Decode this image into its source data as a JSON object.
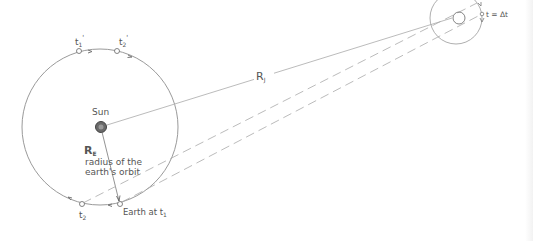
{
  "diagram": {
    "type": "orbital-geometry",
    "colors": {
      "line": "#9a9a9a",
      "text": "#555555",
      "sun": "#666666"
    },
    "sun": {
      "label": "Sun"
    },
    "earth_orbit": {
      "radius_label": "R",
      "radius_subscript": "E",
      "radius_caption_line1": "radius of the",
      "radius_caption_line2": "earth's orbit"
    },
    "positions": {
      "t1_prime": {
        "label": "t",
        "sub": "1",
        "prime": "'"
      },
      "t2_prime": {
        "label": "t",
        "sub": "2",
        "prime": "'"
      },
      "t1": {
        "label": "Earth at t",
        "sub": "1"
      },
      "t2": {
        "label": "t",
        "sub": "2"
      }
    },
    "jupiter_distance": {
      "label": "R",
      "subscript": "J"
    },
    "io": {
      "label": "t = Δt"
    }
  }
}
